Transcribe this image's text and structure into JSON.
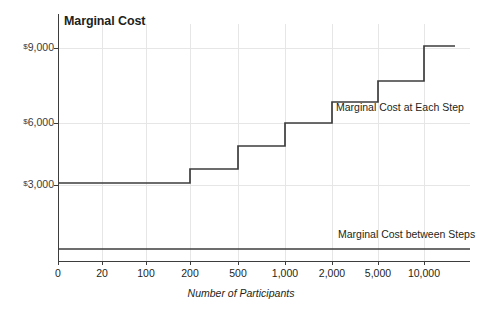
{
  "chart_data": {
    "type": "line",
    "subtype": "step",
    "title": "Marginal Cost",
    "xlabel": "Number of Participants",
    "ylabel": "",
    "grid": true,
    "legend": "none",
    "x_tick_labels": [
      "0",
      "20",
      "100",
      "200",
      "500",
      "1,000",
      "2,000",
      "5,000",
      "10,000"
    ],
    "x_tick_values": [
      0,
      20,
      100,
      200,
      500,
      1000,
      2000,
      5000,
      10000
    ],
    "x_scale": "ordinal-log-like",
    "y_tick_labels": [
      "$9,000",
      "$6,000",
      "$3,000"
    ],
    "y_tick_values": [
      9000,
      6000,
      3000
    ],
    "ylim": [
      0,
      10200
    ],
    "y_currency_symbol": "$",
    "series": [
      {
        "name": "Marginal Cost at Each Step",
        "type": "step",
        "points": [
          {
            "x_label": "0",
            "y": 3100
          },
          {
            "x_label": "200",
            "y": 3100
          },
          {
            "x_label": "200",
            "y": 3800
          },
          {
            "x_label": "500",
            "y": 3800
          },
          {
            "x_label": "500",
            "y": 4900
          },
          {
            "x_label": "1,000",
            "y": 4900
          },
          {
            "x_label": "1,000",
            "y": 6000
          },
          {
            "x_label": "2,000",
            "y": 6000
          },
          {
            "x_label": "2,000",
            "y": 7000
          },
          {
            "x_label": "5,000",
            "y": 7000
          },
          {
            "x_label": "5,000",
            "y": 8000
          },
          {
            "x_label": "10,000",
            "y": 8000
          },
          {
            "x_label": "10,000",
            "y": 9100
          },
          {
            "x_label": "end",
            "y": 9100
          }
        ],
        "step_levels": [
          3100,
          3800,
          4900,
          6000,
          7000,
          8000,
          9100
        ],
        "step_breakpoints": [
          "200",
          "500",
          "1,000",
          "2,000",
          "5,000",
          "10,000"
        ]
      },
      {
        "name": "Marginal Cost between Steps",
        "type": "line",
        "constant_value": 150,
        "points": [
          {
            "x_label": "0",
            "y": 150
          },
          {
            "x_label": "end",
            "y": 150
          }
        ]
      }
    ],
    "annotations": [
      {
        "id": "step-note",
        "text": "Marginal Cost at Each Step"
      },
      {
        "id": "between-note",
        "text": "Marginal Cost between Steps"
      }
    ],
    "colors": {
      "line": "#3d3d3d",
      "axis": "#3d3d3d",
      "grid": "#e3e3e3",
      "text": "#231f20",
      "tick_text": "#3a3a3a",
      "background": "#ffffff"
    }
  }
}
